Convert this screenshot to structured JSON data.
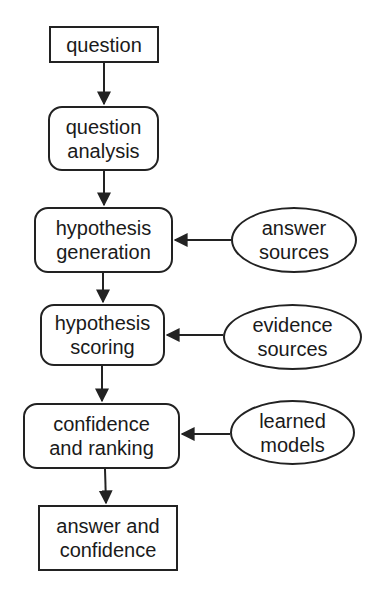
{
  "diagram": {
    "nodes": [
      {
        "id": "question",
        "label": "question",
        "shape": "rectangle"
      },
      {
        "id": "question_analysis",
        "label": "question\nanalysis",
        "shape": "rounded-rectangle"
      },
      {
        "id": "hypothesis_generation",
        "label": "hypothesis\ngeneration",
        "shape": "rounded-rectangle"
      },
      {
        "id": "hypothesis_scoring",
        "label": "hypothesis\nscoring",
        "shape": "rounded-rectangle"
      },
      {
        "id": "confidence_ranking",
        "label": "confidence\nand ranking",
        "shape": "rounded-rectangle"
      },
      {
        "id": "answer_confidence",
        "label": "answer and\nconfidence",
        "shape": "rectangle"
      },
      {
        "id": "answer_sources",
        "label": "answer\nsources",
        "shape": "ellipse"
      },
      {
        "id": "evidence_sources",
        "label": "evidence\nsources",
        "shape": "ellipse"
      },
      {
        "id": "learned_models",
        "label": "learned\nmodels",
        "shape": "ellipse"
      }
    ],
    "edges": [
      {
        "from": "question",
        "to": "question_analysis"
      },
      {
        "from": "question_analysis",
        "to": "hypothesis_generation"
      },
      {
        "from": "hypothesis_generation",
        "to": "hypothesis_scoring"
      },
      {
        "from": "hypothesis_scoring",
        "to": "confidence_ranking"
      },
      {
        "from": "confidence_ranking",
        "to": "answer_confidence"
      },
      {
        "from": "answer_sources",
        "to": "hypothesis_generation"
      },
      {
        "from": "evidence_sources",
        "to": "hypothesis_scoring"
      },
      {
        "from": "learned_models",
        "to": "confidence_ranking"
      }
    ],
    "colors": {
      "stroke": "#222222",
      "background": "#ffffff"
    }
  }
}
